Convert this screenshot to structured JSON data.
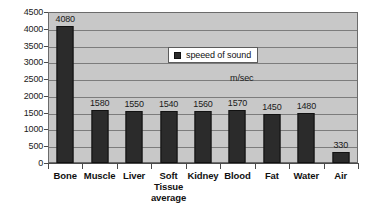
{
  "chart_data": {
    "type": "bar",
    "title": "",
    "xlabel": "",
    "ylabel": "",
    "units_annotation": "m/sec",
    "legend": {
      "position": "inside-top-center",
      "entries": [
        "speeed of sound"
      ]
    },
    "grid": true,
    "ylim": [
      0,
      4500
    ],
    "ytick_step": 500,
    "yticks": [
      "4500",
      "4000",
      "3500",
      "3000",
      "2500",
      "2000",
      "1500",
      "1000",
      "500",
      "0"
    ],
    "categories": [
      "Bone",
      "Muscle",
      "Liver",
      "Soft Tissue average",
      "Kidney",
      "Blood",
      "Fat",
      "Water",
      "Air"
    ],
    "category_lines": [
      [
        "Bone"
      ],
      [
        "Muscle"
      ],
      [
        "Liver"
      ],
      [
        "Soft",
        "Tissue",
        "average"
      ],
      [
        "Kidney"
      ],
      [
        "Blood"
      ],
      [
        "Fat"
      ],
      [
        "Water"
      ],
      [
        "Air"
      ]
    ],
    "series": [
      {
        "name": "speeed of sound",
        "values": [
          4080,
          1580,
          1550,
          1540,
          1560,
          1570,
          1450,
          1480,
          330
        ]
      }
    ],
    "value_labels": [
      "4080",
      "1580",
      "1550",
      "1540",
      "1560",
      "1570",
      "1450",
      "1480",
      "330"
    ],
    "colors": {
      "bar": "#2b2b2b",
      "bar_border": "#111111",
      "plot_background": "#c8c8c8",
      "gridline": "#7c7c7c",
      "axis": "#4a4a4a",
      "page_background": "#ffffff",
      "text": "#111111"
    }
  }
}
